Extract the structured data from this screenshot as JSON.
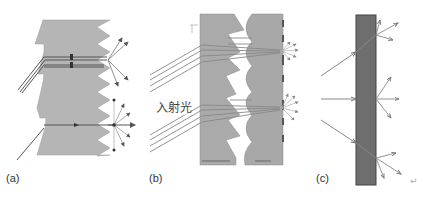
{
  "figure": {
    "panels": [
      {
        "id": "a",
        "label": "(a)",
        "description": "Sawtooth-edged prism sheet with incident rays refracted and scattered at the serrated surface"
      },
      {
        "id": "b",
        "label": "(b)",
        "description": "Prism sheet paired with lenticular lens sheet focusing incident light",
        "incident_light_label": "入射光"
      },
      {
        "id": "c",
        "label": "(c)",
        "description": "Dark diffuser slab scattering incident rays"
      }
    ],
    "trailing_mark": "↵",
    "colors": {
      "light_gray_fill": "#b3b3b3",
      "mid_gray_fill": "#a9a9a9",
      "dark_slab_fill": "#6b6b6b",
      "ray_color": "#555555",
      "outline": "#777777"
    }
  }
}
